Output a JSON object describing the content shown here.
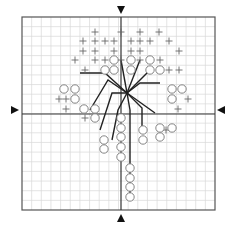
{
  "diagram": {
    "type": "grid-scatter-with-leader-lines",
    "grid": {
      "x": 22,
      "y": 17,
      "size": 193,
      "cells": 20,
      "minor_color": "#d8d8d8",
      "border_color": "#555555"
    },
    "axes": {
      "vertical_x": 121,
      "horizontal_y": 114,
      "color": "#333333"
    },
    "markers": {
      "top": {
        "x": 121,
        "y": 10,
        "dir": "down"
      },
      "bottom": {
        "x": 121,
        "y": 218,
        "dir": "up"
      },
      "left": {
        "x": 15,
        "y": 110,
        "dir": "right"
      },
      "right": {
        "x": 221,
        "y": 110,
        "dir": "left"
      }
    },
    "hub": {
      "x": 127,
      "y": 93
    },
    "leader_lines": [
      {
        "points": [
          [
            127,
            93
          ],
          [
            121,
            60
          ]
        ]
      },
      {
        "points": [
          [
            127,
            93
          ],
          [
            140,
            60
          ]
        ]
      },
      {
        "points": [
          [
            127,
            93
          ],
          [
            150,
            70
          ]
        ]
      },
      {
        "points": [
          [
            127,
            93
          ],
          [
            140,
            83
          ],
          [
            160,
            83
          ]
        ]
      },
      {
        "points": [
          [
            127,
            93
          ],
          [
            155,
            113
          ]
        ]
      },
      {
        "points": [
          [
            127,
            93
          ],
          [
            142,
            108
          ],
          [
            142,
            134
          ]
        ]
      },
      {
        "points": [
          [
            127,
            93
          ],
          [
            130,
            110
          ],
          [
            130,
            195
          ]
        ]
      },
      {
        "points": [
          [
            127,
            93
          ],
          [
            118,
            110
          ],
          [
            112,
            140
          ]
        ]
      },
      {
        "points": [
          [
            127,
            93
          ],
          [
            112,
            93
          ],
          [
            100,
            130
          ]
        ]
      },
      {
        "points": [
          [
            127,
            93
          ],
          [
            105,
            73
          ],
          [
            80,
            73
          ]
        ]
      },
      {
        "points": [
          [
            127,
            93
          ],
          [
            108,
            80
          ],
          [
            90,
            110
          ]
        ]
      }
    ],
    "plus_symbols": [
      [
        95,
        32
      ],
      [
        121,
        32
      ],
      [
        140,
        32
      ],
      [
        159,
        32
      ],
      [
        83,
        41
      ],
      [
        95,
        41
      ],
      [
        105,
        41
      ],
      [
        114,
        41
      ],
      [
        131,
        41
      ],
      [
        140,
        41
      ],
      [
        150,
        41
      ],
      [
        169,
        41
      ],
      [
        83,
        51
      ],
      [
        95,
        51
      ],
      [
        114,
        51
      ],
      [
        131,
        51
      ],
      [
        140,
        51
      ],
      [
        179,
        51
      ],
      [
        75,
        60
      ],
      [
        95,
        60
      ],
      [
        105,
        60
      ],
      [
        121,
        60
      ],
      [
        140,
        60
      ],
      [
        160,
        60
      ],
      [
        85,
        70
      ],
      [
        169,
        70
      ],
      [
        179,
        70
      ],
      [
        59,
        99
      ],
      [
        66,
        99
      ],
      [
        188,
        99
      ],
      [
        66,
        109
      ],
      [
        178,
        109
      ],
      [
        85,
        118
      ],
      [
        166,
        130
      ]
    ],
    "circle_symbols": [
      [
        114,
        60
      ],
      [
        131,
        60
      ],
      [
        150,
        60
      ],
      [
        105,
        70
      ],
      [
        114,
        70
      ],
      [
        131,
        70
      ],
      [
        150,
        70
      ],
      [
        160,
        70
      ],
      [
        64,
        89
      ],
      [
        75,
        89
      ],
      [
        172,
        89
      ],
      [
        182,
        89
      ],
      [
        75,
        99
      ],
      [
        172,
        99
      ],
      [
        84,
        109
      ],
      [
        95,
        109
      ],
      [
        95,
        118
      ],
      [
        121,
        118
      ],
      [
        121,
        128
      ],
      [
        121,
        137
      ],
      [
        121,
        147
      ],
      [
        121,
        157
      ],
      [
        160,
        128
      ],
      [
        172,
        128
      ],
      [
        160,
        137
      ],
      [
        143,
        130
      ],
      [
        143,
        140
      ],
      [
        104,
        140
      ],
      [
        104,
        149
      ],
      [
        130,
        168
      ],
      [
        130,
        178
      ],
      [
        130,
        187
      ],
      [
        130,
        197
      ]
    ]
  }
}
